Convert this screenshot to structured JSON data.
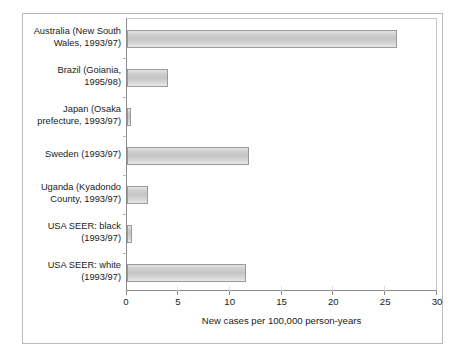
{
  "chart_data": {
    "type": "bar",
    "orientation": "horizontal",
    "title": "",
    "subtitle": "",
    "xlabel": "New cases per 100,000 person-years",
    "ylabel": "",
    "xlim": [
      0,
      30
    ],
    "xticks": [
      0,
      5,
      10,
      15,
      20,
      25,
      30
    ],
    "xtick_labels": [
      "0",
      "5",
      "10",
      "15",
      "20",
      "25",
      "30"
    ],
    "grid": false,
    "legend": null,
    "categories": [
      "Australia (New South\nWales, 1993/97)",
      "Brazil (Goiania,\n1995/98)",
      "Japan (Osaka\nprefecture, 1993/97)",
      "Sweden (1993/97)",
      "Uganda (Kyadondo\nCounty, 1993/97)",
      "USA SEER: black\n(1993/97)",
      "USA SEER: white\n(1993/97)"
    ],
    "values": [
      26.0,
      4.0,
      0.4,
      11.8,
      2.0,
      0.5,
      11.5
    ],
    "series": [
      {
        "name": "New cases per 100,000 person-years",
        "values": [
          26.0,
          4.0,
          0.4,
          11.8,
          2.0,
          0.5,
          11.5
        ]
      }
    ],
    "bar_fill_color": "#cfcfcf",
    "bar_edge_color": "#9a9a9a",
    "axis_color": "#8a8a8a",
    "background_color": "#ffffff",
    "frame_color": "#b9b9b9"
  }
}
